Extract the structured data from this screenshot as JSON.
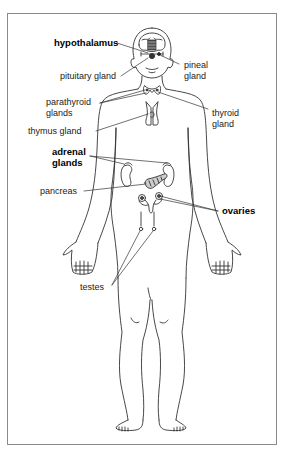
{
  "diagram": {
    "labels": {
      "hypothalamus": "hypothalamus",
      "pineal_line1": "pineal",
      "pineal_line2": "gland",
      "pituitary": "pituitary gland",
      "parathyroid_line1": "parathyroid",
      "parathyroid_line2": "glands",
      "thyroid_line1": "thyroid",
      "thyroid_line2": "gland",
      "thymus": "thymus gland",
      "adrenal_line1": "adrenal",
      "adrenal_line2": "glands",
      "pancreas": "pancreas",
      "ovaries": "ovaries",
      "testes": "testes"
    },
    "bold_labels": [
      "hypothalamus",
      "adrenal glands",
      "ovaries"
    ],
    "colors": {
      "line": "#333333",
      "frame": "#8a8a8a",
      "background": "#ffffff"
    }
  }
}
